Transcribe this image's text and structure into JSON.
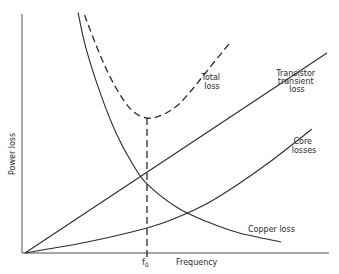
{
  "chart_data": {
    "type": "line",
    "title": "",
    "xlabel": "Frequency",
    "ylabel": "Power loss",
    "x_ticks": [
      {
        "label": "f0",
        "subscript": "0",
        "base": "f",
        "x": 4.0
      }
    ],
    "y_ticks": [],
    "xlim": [
      0,
      10
    ],
    "ylim": [
      0,
      10
    ],
    "grid": false,
    "legend": "inline annotations",
    "series": [
      {
        "name": "Copper loss",
        "style": "solid",
        "points": [
          [
            1.74,
            10.1
          ],
          [
            2.0,
            8.6
          ],
          [
            2.5,
            6.6
          ],
          [
            3.0,
            5.0
          ],
          [
            3.5,
            3.8
          ],
          [
            4.0,
            2.9
          ],
          [
            5.0,
            1.9
          ],
          [
            6.0,
            1.3
          ],
          [
            7.0,
            0.85
          ],
          [
            8.4,
            0.46
          ]
        ]
      },
      {
        "name": "Transistor transient loss",
        "style": "solid",
        "points": [
          [
            0,
            0
          ],
          [
            9.9,
            8.4
          ]
        ]
      },
      {
        "name": "Core losses",
        "style": "solid",
        "points": [
          [
            0,
            0
          ],
          [
            2.0,
            0.45
          ],
          [
            4.0,
            1.05
          ],
          [
            5.0,
            1.5
          ],
          [
            6.0,
            2.1
          ],
          [
            7.0,
            2.9
          ],
          [
            8.0,
            3.8
          ],
          [
            9.4,
            5.2
          ]
        ]
      },
      {
        "name": "Total loss",
        "style": "dashed",
        "points": [
          [
            1.95,
            10.0
          ],
          [
            2.5,
            8.2
          ],
          [
            3.0,
            6.9
          ],
          [
            3.5,
            6.0
          ],
          [
            4.0,
            5.67
          ],
          [
            4.5,
            5.8
          ],
          [
            5.0,
            6.2
          ],
          [
            5.5,
            6.9
          ],
          [
            6.0,
            7.7
          ],
          [
            6.7,
            8.8
          ]
        ]
      }
    ],
    "annotations": [
      {
        "text": "Total loss",
        "near": [
          6.9,
          9.0
        ]
      },
      {
        "text": "Transistor transient loss",
        "near": [
          9.2,
          8.8
        ]
      },
      {
        "text": "Core losses",
        "near": [
          9.3,
          5.0
        ]
      },
      {
        "text": "Copper loss",
        "near": [
          7.8,
          0.9
        ]
      },
      {
        "text": "vertical dashed line at f0 from total-loss minimum down to x-axis",
        "x": 4.0
      }
    ]
  },
  "labels": {
    "ylabel": "Power loss",
    "xlabel": "Frequency",
    "f0_base": "f",
    "f0_sub": "0",
    "total_line1": "Total",
    "total_line2": "loss",
    "transistor_line1": "Transistor",
    "transistor_line2": "transient",
    "transistor_line3": "loss",
    "core_line1": "Core",
    "core_line2": "losses",
    "copper": "Copper loss"
  }
}
